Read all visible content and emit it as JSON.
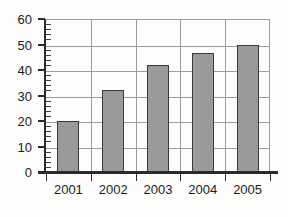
{
  "chart_data": {
    "type": "bar",
    "title": "",
    "subtitle": "",
    "xlabel": "",
    "ylabel": "",
    "categories": [
      "2001",
      "2002",
      "2003",
      "2004",
      "2005"
    ],
    "values": [
      20,
      32,
      42,
      46.5,
      50
    ],
    "ylim": [
      0,
      60
    ],
    "y_major_ticks": [
      0,
      10,
      20,
      30,
      40,
      50,
      60
    ],
    "y_tick_labels": [
      "0",
      "10",
      "20",
      "30",
      "40",
      "50",
      "60"
    ],
    "y_minor_tick_interval": 2,
    "grid": "both",
    "legend": "none",
    "bar_fill_color": "#9a9a9a",
    "bar_edge_color": "#3a3a3a",
    "gridline_color": "#9c9c9c",
    "axis_color": "#2a2a2a",
    "background_color": "#fdfdfb",
    "text_color": "#1b1b1b"
  }
}
